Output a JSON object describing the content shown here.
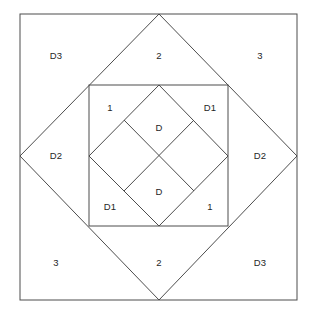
{
  "figure": {
    "kind": "nested-squares-and-diamonds-diagram",
    "canvas": {
      "width": 316,
      "height": 315
    },
    "stroke_color": "#4d4d4d",
    "stroke_width": 1,
    "background_color": "#ffffff",
    "label_color": "#262626",
    "shapes": {
      "outer_square": {
        "name": "outer-square",
        "x1": 20,
        "y1": 14,
        "x2": 297,
        "y2": 300
      },
      "outer_diamond": {
        "name": "outer-diamond",
        "points": "159,14 297,156 159,300 20,156"
      },
      "middle_square": {
        "name": "middle-square",
        "x1": 89,
        "y1": 85,
        "x2": 228,
        "y2": 226
      },
      "inner_diamond": {
        "name": "inner-diamond",
        "points": "159,85 228,156 159,226 89,156"
      },
      "cross_line_a": {
        "name": "inner-cross-line-nw-se",
        "x1": 124,
        "y1": 120,
        "x2": 194,
        "y2": 191
      },
      "cross_line_b": {
        "name": "inner-cross-line-ne-sw",
        "x1": 194,
        "y1": 120,
        "x2": 124,
        "y2": 191
      }
    },
    "labels": [
      {
        "id": "label-d3-top-left",
        "text": "D3",
        "x": 56,
        "y": 56
      },
      {
        "id": "label-2-top",
        "text": "2",
        "x": 159,
        "y": 56
      },
      {
        "id": "label-3-top-right",
        "text": "3",
        "x": 260,
        "y": 56
      },
      {
        "id": "label-1-inner-top-left",
        "text": "1",
        "x": 110,
        "y": 108
      },
      {
        "id": "label-d1-inner-top-right",
        "text": "D1",
        "x": 210,
        "y": 108
      },
      {
        "id": "label-d-upper",
        "text": "D",
        "x": 159,
        "y": 128
      },
      {
        "id": "label-d2-left",
        "text": "D2",
        "x": 56,
        "y": 156
      },
      {
        "id": "label-d2-right",
        "text": "D2",
        "x": 260,
        "y": 156
      },
      {
        "id": "label-d-lower",
        "text": "D",
        "x": 159,
        "y": 192
      },
      {
        "id": "label-d1-inner-bottom-left",
        "text": "D1",
        "x": 110,
        "y": 207
      },
      {
        "id": "label-1-inner-bottom-right",
        "text": "1",
        "x": 210,
        "y": 207
      },
      {
        "id": "label-3-bottom-left",
        "text": "3",
        "x": 56,
        "y": 263
      },
      {
        "id": "label-2-bottom",
        "text": "2",
        "x": 159,
        "y": 263
      },
      {
        "id": "label-d3-bottom-right",
        "text": "D3",
        "x": 260,
        "y": 263
      }
    ]
  }
}
